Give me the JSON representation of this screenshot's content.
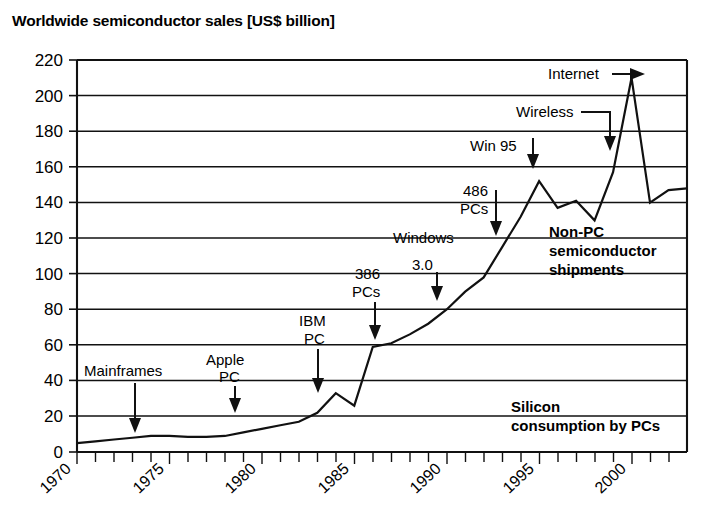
{
  "chart_data": {
    "type": "line",
    "title": "Worldwide semiconductor sales [US$ billion]",
    "xlabel": "",
    "ylabel": "",
    "ylim": [
      0,
      220
    ],
    "xlim": [
      1970,
      2003
    ],
    "grid": true,
    "legend_position": "none",
    "y_ticks": [
      0,
      20,
      40,
      60,
      80,
      100,
      120,
      140,
      160,
      180,
      200,
      220
    ],
    "x_ticks": [
      1970,
      1975,
      1980,
      1985,
      1990,
      1995,
      2000
    ],
    "x_tick_labels": [
      "1970",
      "1975",
      "1980",
      "1985",
      "1990",
      "1995",
      "2000"
    ],
    "x_minor_tick_interval": 1,
    "series": [
      {
        "name": "Worldwide semiconductor sales",
        "x": [
          1970,
          1971,
          1972,
          1973,
          1974,
          1975,
          1976,
          1977,
          1978,
          1979,
          1980,
          1981,
          1982,
          1983,
          1984,
          1985,
          1986,
          1987,
          1988,
          1989,
          1990,
          1991,
          1992,
          1993,
          1994,
          1995,
          1996,
          1997,
          1998,
          1999,
          2000,
          2001,
          2002,
          2003
        ],
        "values": [
          5,
          6,
          7,
          8,
          9,
          9,
          8.5,
          8.5,
          9,
          11,
          13,
          15,
          17,
          22,
          33,
          26,
          59,
          61,
          66,
          72,
          80,
          90,
          98,
          115,
          132,
          152,
          137,
          141,
          130,
          157,
          210,
          140,
          147,
          148
        ]
      }
    ],
    "annotations": [
      {
        "id": "mainframes",
        "text": "Mainframes",
        "lines": [
          "Mainframes"
        ],
        "bold": false,
        "arrow": "down",
        "arrow_year": 1974
      },
      {
        "id": "apple-pc",
        "text": "Apple PC",
        "lines": [
          "Apple",
          "PC"
        ],
        "bold": false,
        "arrow": "down",
        "arrow_year": 1979
      },
      {
        "id": "ibm-pc",
        "text": "IBM PC",
        "lines": [
          "IBM",
          "PC"
        ],
        "bold": false,
        "arrow": "down",
        "arrow_year": 1983
      },
      {
        "id": "386-pcs",
        "text": "386 PCs",
        "lines": [
          "386",
          "PCs"
        ],
        "bold": false,
        "arrow": "down",
        "arrow_year": 1986
      },
      {
        "id": "windows-30",
        "text": "Windows 3.0",
        "lines": [
          "Windows",
          "3.0"
        ],
        "bold": false,
        "arrow": "down",
        "arrow_year": 1990
      },
      {
        "id": "486-pcs",
        "text": "486 PCs",
        "lines": [
          "486",
          "PCs"
        ],
        "bold": false,
        "arrow": "down",
        "arrow_year": 1993
      },
      {
        "id": "win-95",
        "text": "Win 95",
        "lines": [
          "Win 95"
        ],
        "bold": false,
        "arrow": "down",
        "arrow_year": 1995
      },
      {
        "id": "wireless",
        "text": "Wireless",
        "lines": [
          "Wireless"
        ],
        "bold": false,
        "arrow": "elbow-down",
        "arrow_year": 1999
      },
      {
        "id": "internet",
        "text": "Internet",
        "lines": [
          "Internet"
        ],
        "bold": false,
        "arrow": "right",
        "arrow_year": 2000
      },
      {
        "id": "non-pc",
        "text": "Non-PC semiconductor shipments",
        "lines": [
          "Non-PC",
          "semiconductor",
          "shipments"
        ],
        "bold": true,
        "arrow": "none"
      },
      {
        "id": "silicon-pc",
        "text": "Silicon consumption by PCs",
        "lines": [
          "Silicon",
          "consumption by PCs"
        ],
        "bold": true,
        "arrow": "none"
      }
    ]
  },
  "labels": {
    "y": {
      "t220": "220",
      "t200": "200",
      "t180": "180",
      "t160": "160",
      "t140": "140",
      "t120": "120",
      "t100": "100",
      "t80": "80",
      "t60": "60",
      "t40": "40",
      "t20": "20",
      "t0": "0"
    },
    "x": {
      "x1970": "1970",
      "x1975": "1975",
      "x1980": "1980",
      "x1985": "1985",
      "x1990": "1990",
      "x1995": "1995",
      "x2000": "2000"
    },
    "annotations": {
      "mainframes": "Mainframes",
      "apple_1": "Apple",
      "apple_2": "PC",
      "ibm_1": "IBM",
      "ibm_2": "PC",
      "p386_1": "386",
      "p386_2": "PCs",
      "windows_1": "Windows",
      "windows_2": "3.0",
      "p486_1": "486",
      "p486_2": "PCs",
      "win95": "Win 95",
      "wireless": "Wireless",
      "internet": "Internet",
      "nonpc_1": "Non-PC",
      "nonpc_2": "semiconductor",
      "nonpc_3": "shipments",
      "silicon_1": "Silicon",
      "silicon_2": "consumption by PCs"
    }
  },
  "colors": {
    "ink": "#111111",
    "background": "#ffffff"
  }
}
